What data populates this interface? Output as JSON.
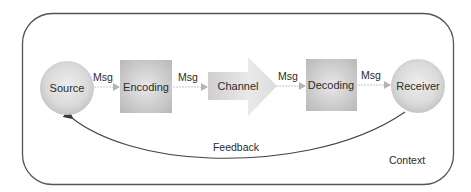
{
  "diagram": {
    "nodes": [
      {
        "id": "source",
        "label": "Source",
        "shape": "circle"
      },
      {
        "id": "encoding",
        "label": "Encoding",
        "shape": "square"
      },
      {
        "id": "channel",
        "label": "Channel",
        "shape": "arrow"
      },
      {
        "id": "decoding",
        "label": "Decoding",
        "shape": "square"
      },
      {
        "id": "receiver",
        "label": "Receiver",
        "shape": "circle"
      }
    ],
    "edges": [
      {
        "from": "source",
        "to": "encoding",
        "label": "Msg"
      },
      {
        "from": "encoding",
        "to": "channel",
        "label": "Msg"
      },
      {
        "from": "channel",
        "to": "decoding",
        "label": "Msg"
      },
      {
        "from": "decoding",
        "to": "receiver",
        "label": "Msg"
      },
      {
        "from": "receiver",
        "to": "source",
        "label": "Feedback",
        "style": "curved"
      }
    ],
    "container_label": "Context",
    "colors": {
      "frame": "#555555",
      "node_fill_light": "#e6e6e6",
      "node_fill_dark": "#b9b9b9",
      "msg_arrow": "#bdbdbd",
      "feedback_line": "#444444"
    }
  }
}
